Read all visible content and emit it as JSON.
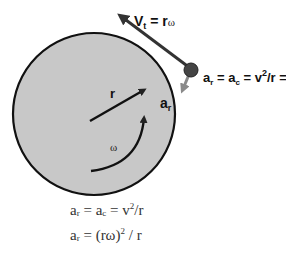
{
  "diagram": {
    "colors": {
      "disk_fill": "#c8c8c8",
      "disk_stroke": "#111111",
      "mass_fill": "#444444",
      "arrow_dark": "#222222",
      "arrow_accel": "#7a7a7a",
      "background": "#ffffff"
    },
    "labels": {
      "velocity": {
        "base": "V",
        "sub": "t",
        "rest": " = r",
        "omega": "ω"
      },
      "accel_top": {
        "a": "a",
        "a_sub": "r",
        "eq1": " = a",
        "c_sub": "c",
        "eq2": " = v",
        "sup2": "2",
        "eq3": "/r =r ",
        "omega": "ω",
        "sup_end": "2"
      },
      "accel_short": {
        "base": "a",
        "sub": "r"
      },
      "radius": "r",
      "angular_velocity": "ω"
    },
    "equations": [
      {
        "lhs": "a",
        "lhs_sub": "r",
        "mid": " = a",
        "mid_sub": "c",
        "rhs": " = v",
        "rhs_sup": "2",
        "tail": "/r"
      },
      {
        "lhs": "a",
        "lhs_sub": "r",
        "rhs": " = (rω)",
        "rhs_sup": "2",
        "tail": " / r"
      }
    ]
  }
}
